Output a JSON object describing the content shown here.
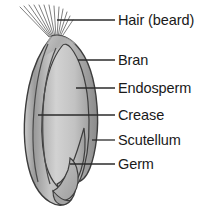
{
  "diagram": {
    "background_color": "#ffffff",
    "line_color": "#2b2b2b",
    "grain_fill_light": "#d8d8d8",
    "grain_fill_mid": "#b5b5b5",
    "grain_fill_dark": "#8f8f8f",
    "grain_outline_color": "#3a3a3a",
    "text_color": "#1a1a1a"
  },
  "labels": [
    {
      "id": "hair",
      "text": "Hair (beard)",
      "leader_from_x": 57,
      "leader_to_x": 115,
      "leader_y": 20
    },
    {
      "id": "bran",
      "text": "Bran",
      "leader_from_x": 78,
      "leader_to_x": 115,
      "leader_y": 60
    },
    {
      "id": "endosperm",
      "text": "Endosperm",
      "leader_from_x": 76,
      "leader_to_x": 115,
      "leader_y": 88
    },
    {
      "id": "crease",
      "text": "Crease",
      "leader_from_x": 38,
      "leader_to_x": 115,
      "leader_y": 115
    },
    {
      "id": "scutellum",
      "text": "Scutellum",
      "leader_from_x": 92,
      "leader_to_x": 115,
      "leader_y": 140
    },
    {
      "id": "germ",
      "text": "Germ",
      "leader_from_x": 70,
      "leader_to_x": 115,
      "leader_y": 164
    }
  ],
  "parts": [
    {
      "id": "hair",
      "name": "Hair (beard)",
      "description": "Fine bristles fanning from the brush end at the top of the kernel"
    },
    {
      "id": "bran",
      "name": "Bran",
      "description": "Outer multilayer protective coat of the kernel"
    },
    {
      "id": "endosperm",
      "name": "Endosperm",
      "description": "Large starchy inner body of the kernel"
    },
    {
      "id": "crease",
      "name": "Crease",
      "description": "Longitudinal infold running along the kernel"
    },
    {
      "id": "scutellum",
      "name": "Scutellum",
      "description": "Shield-shaped tissue separating germ from endosperm"
    },
    {
      "id": "germ",
      "name": "Germ",
      "description": "Embryo at the lower end of the kernel"
    }
  ]
}
